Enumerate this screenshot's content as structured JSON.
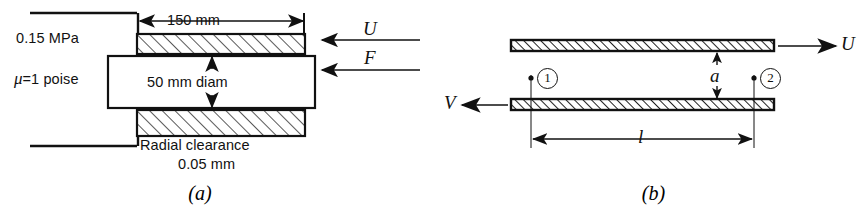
{
  "figure": {
    "panels": [
      {
        "id": "a",
        "caption": "(a)",
        "labels": {
          "pressure": "0.15 MPa",
          "viscosity_symbol": "μ",
          "viscosity_value": "=1 poise",
          "viscosity_full": "μ=1 poise",
          "length_dim": "150 mm",
          "diameter_dim": "50 mm diam",
          "clearance_line1": "Radial clearance",
          "clearance_line2": "0.05 mm",
          "velocity_arrow": "U",
          "force_arrow": "F"
        }
      },
      {
        "id": "b",
        "caption": "(b)",
        "labels": {
          "top_plate_velocity": "U",
          "bottom_plate_velocity": "V",
          "gap_dim": "a",
          "length_dim": "l",
          "point_1": "1",
          "point_2": "2"
        }
      }
    ]
  },
  "style": {
    "line_color": "#111111",
    "hatch_color": "#222222",
    "background": "#ffffff"
  }
}
